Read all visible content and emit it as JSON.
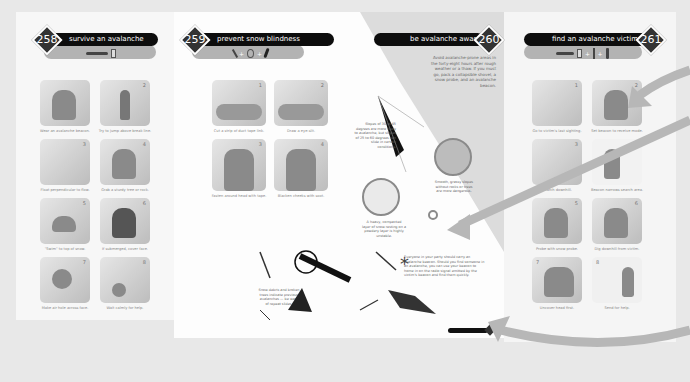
{
  "sections": [
    {
      "number": "258",
      "title": "survive an avalanche",
      "tools": [
        "avalanche-beacon"
      ],
      "steps": [
        {
          "n": "1",
          "caption": "Wear an avalanche beacon."
        },
        {
          "n": "2",
          "caption": "Try to jump above break line."
        },
        {
          "n": "3",
          "caption": "Float perpendicular to flow."
        },
        {
          "n": "4",
          "caption": "Grab a sturdy tree or rock."
        },
        {
          "n": "5",
          "caption": "\"Swim\" to top of snow."
        },
        {
          "n": "6",
          "caption": "If submerged, cover face."
        },
        {
          "n": "7",
          "caption": "Make air hole across face."
        },
        {
          "n": "8",
          "caption": "Wait calmly for help."
        }
      ]
    },
    {
      "number": "259",
      "title": "prevent snow blindness",
      "tools": [
        "knife",
        "tape",
        "marker"
      ],
      "steps": [
        {
          "n": "1",
          "caption": "Cut a strip of duct tape link."
        },
        {
          "n": "2",
          "caption": "Draw a eye-slit."
        },
        {
          "n": "3",
          "caption": "Fasten around head with tape."
        },
        {
          "n": "4",
          "caption": "Blacken cheeks with soot."
        }
      ]
    },
    {
      "number": "260",
      "title": "be avalanche aware",
      "intro": "Avoid avalanche-prone areas in the forty-eight hours after rough weather or a thaw. If you must go, pack a collapsible shovel, a snow probe, and an avalanche beacon.",
      "notes": [
        "Slopes of 30 to 45 degrees are more likely to avalanche, but slopes of 25 to 60 degrees can slide in certain conditions.",
        "Smooth, grassy slopes without rocks or trees are more dangerous.",
        "A heavy, compacted layer of snow resting on a powdery layer is highly unstable.",
        "Snow debris and broken trees indicate previous avalanches — be wary of repeat slides.",
        "Everyone in your party should carry an avalanche beacon. Should you find someone in an avalanche, you can use your beacon to home in on the radio signal emitted by the victim's beacon and find them quickly."
      ],
      "footer_tab": "be avalanche aware"
    },
    {
      "number": "261",
      "title": "find an avalanche victim",
      "tools": [
        "avalanche-beacon",
        "probe",
        "shovel"
      ],
      "steps": [
        {
          "n": "1",
          "caption": "Go to victim's last sighting."
        },
        {
          "n": "2",
          "caption": "Set beacon to receive mode."
        },
        {
          "n": "3",
          "caption": "Search downhill."
        },
        {
          "n": "4",
          "caption": "Beacon narrows search area."
        },
        {
          "n": "5",
          "caption": "Probe with snow probe."
        },
        {
          "n": "6",
          "caption": "Dig downhill from victim."
        },
        {
          "n": "7",
          "caption": "Uncover head first."
        },
        {
          "n": "8",
          "caption": "Send for help."
        }
      ]
    }
  ],
  "colors": {
    "header_bar": "#0d0d0d",
    "sub_bar": "#b3b3b3",
    "diamond": "#333333",
    "arrow": "#b7b7b7",
    "page": "#fafafa",
    "background": "#e8e8e8"
  }
}
